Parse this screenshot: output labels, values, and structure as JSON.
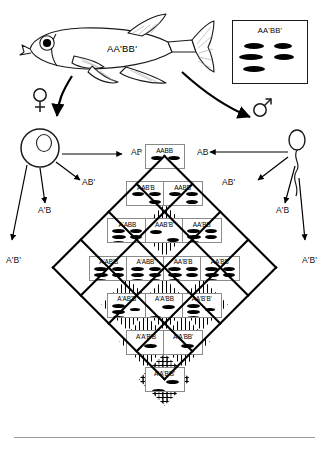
{
  "diagram": {
    "parent_fish": {
      "genotype_label": "AA'BB'",
      "icon": "fish-icon"
    },
    "legend": {
      "title": "AA'BB'",
      "spot_count": 5,
      "spots": [
        {
          "x": 11,
          "y": 2,
          "w": 20,
          "h": 6
        },
        {
          "x": 41,
          "y": 2,
          "w": 18,
          "h": 6
        },
        {
          "x": 6,
          "y": 13,
          "w": 24,
          "h": 6
        },
        {
          "x": 41,
          "y": 13,
          "w": 20,
          "h": 6
        },
        {
          "x": 10,
          "y": 25,
          "w": 22,
          "h": 6
        }
      ]
    },
    "female_symbol": "♀",
    "male_symbol": "♂",
    "maternal_gametes": [
      "AB",
      "AB'",
      "A'B",
      "A'B'"
    ],
    "paternal_gametes": [
      "AB",
      "AB'",
      "A'B",
      "A'B'"
    ],
    "gamete_labels": {
      "left_top": "AB",
      "left_second": "AB'",
      "left_third": "A'B",
      "left_fourth": "A'B'",
      "right_top": "AB",
      "right_second": "AB'",
      "right_third": "A'B",
      "right_fourth": "A'B'"
    },
    "grid": {
      "rows": [
        [
          {
            "genotype": "AABB",
            "spots": 2,
            "fill": "white"
          }
        ],
        [
          {
            "genotype": "AAB'B",
            "spots": 3,
            "fill": "white"
          },
          {
            "genotype": "AABB'",
            "spots": 3,
            "fill": "white"
          }
        ],
        [
          {
            "genotype": "A'ABB",
            "spots": 5,
            "fill": "white"
          },
          {
            "genotype": "AAB'B'",
            "spots": 2,
            "fill": "hatch"
          },
          {
            "genotype": "AA'BB",
            "spots": 5,
            "fill": "white"
          }
        ],
        [
          {
            "genotype": "A'AB'B",
            "spots": 5,
            "fill": "white"
          },
          {
            "genotype": "A'ABB'",
            "spots": 6,
            "fill": "white"
          },
          {
            "genotype": "AA'B'B",
            "spots": 5,
            "fill": "white"
          },
          {
            "genotype": "AA'BB'",
            "spots": 5,
            "fill": "white"
          }
        ],
        [
          {
            "genotype": "A'AB'B'",
            "spots": 4,
            "fill": "hatch"
          },
          {
            "genotype": "A'A'BB",
            "spots": 2,
            "fill": "hatch"
          },
          {
            "genotype": "AA'B'B'",
            "spots": 4,
            "fill": "hatch"
          }
        ],
        [
          {
            "genotype": "A'A'B'B",
            "spots": 2,
            "fill": "hatch"
          },
          {
            "genotype": "A'A'BB'",
            "spots": 2,
            "fill": "hatch"
          }
        ],
        [
          {
            "genotype": "A'A'B'B'",
            "spots": 2,
            "fill": "cross"
          }
        ]
      ]
    }
  }
}
